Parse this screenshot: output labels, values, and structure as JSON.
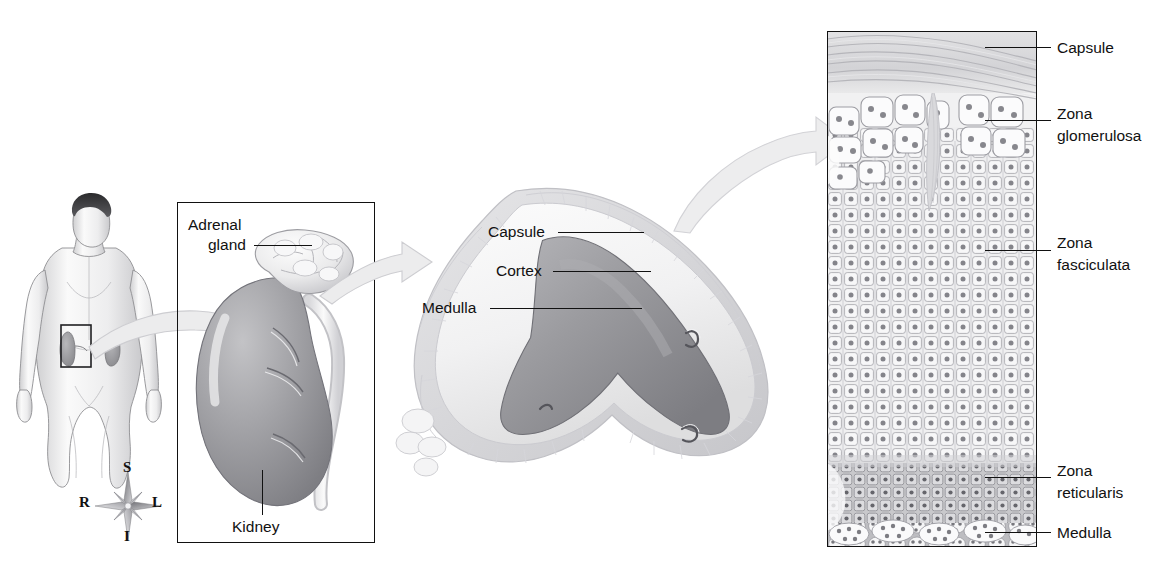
{
  "figure": {
    "panels": [
      {
        "id": "body",
        "name": "body-orientation-panel"
      },
      {
        "id": "kidney",
        "name": "kidney-gross-panel"
      },
      {
        "id": "section",
        "name": "adrenal-section-panel"
      },
      {
        "id": "histology",
        "name": "adrenal-histology-panel"
      }
    ]
  },
  "compass": {
    "superior": "S",
    "inferior": "I",
    "right": "R",
    "left": "L"
  },
  "kidney_panel": {
    "labels": {
      "adrenal_gland_line1": "Adrenal",
      "adrenal_gland_line2": "gland",
      "kidney": "Kidney"
    }
  },
  "section_panel": {
    "labels": {
      "capsule": "Capsule",
      "cortex": "Cortex",
      "medulla": "Medulla"
    }
  },
  "histology_panel": {
    "labels": {
      "capsule": "Capsule",
      "zona_glomerulosa_line1": "Zona",
      "zona_glomerulosa_line2": "glomerulosa",
      "zona_fasciculata_line1": "Zona",
      "zona_fasciculata_line2": "fasciculata",
      "zona_reticularis_line1": "Zona",
      "zona_reticularis_line2": "reticularis",
      "medulla": "Medulla"
    }
  },
  "colors": {
    "ink": "#111111",
    "medulla_fill": "#8e8e90",
    "cortex_fill": "#f3f3f4",
    "kidney_fill": "#9a9a9d",
    "adrenal_fill": "#e9e9ea",
    "arrow_fill": "#ebebec",
    "arrow_stroke": "#cfcfd2",
    "cell_fill": "#f4f4f5",
    "cell_stroke": "#a9a9ad",
    "nucleus": "#6d6d72",
    "skin": "#f2f2f3"
  }
}
